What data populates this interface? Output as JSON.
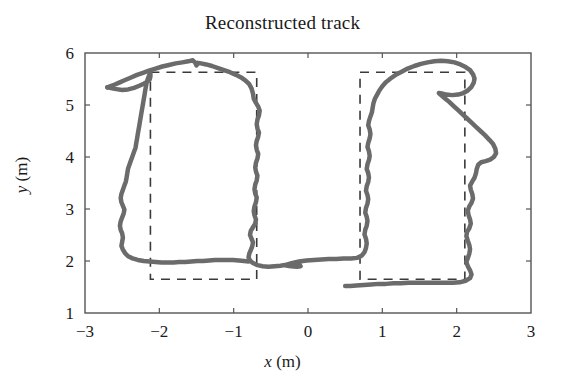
{
  "chart_data": {
    "type": "line",
    "title": "Reconstructed track",
    "xlabel": "x (m)",
    "ylabel": "y (m)",
    "xlabel_var": "x",
    "xlabel_unit": "(m)",
    "ylabel_var": "y",
    "ylabel_unit": "(m)",
    "xlim": [
      -3,
      3
    ],
    "ylim": [
      1,
      6
    ],
    "xticks": [
      -3,
      -2,
      -1,
      0,
      1,
      2,
      3
    ],
    "xtick_labels": [
      "−3",
      "−2",
      "−1",
      "0",
      "1",
      "2",
      "3"
    ],
    "yticks": [
      1,
      2,
      3,
      4,
      5,
      6
    ],
    "ytick_labels": [
      "1",
      "2",
      "3",
      "4",
      "5",
      "6"
    ],
    "grid": false,
    "legend": null,
    "series": [
      {
        "name": "reconstructed track",
        "style": "solid",
        "color": "#6b6b6b",
        "linewidth": 4.5,
        "points": [
          [
            -2.7,
            5.34
          ],
          [
            -2.62,
            5.38
          ],
          [
            -2.54,
            5.43
          ],
          [
            -2.46,
            5.48
          ],
          [
            -2.38,
            5.53
          ],
          [
            -2.3,
            5.58
          ],
          [
            -2.22,
            5.62
          ],
          [
            -2.14,
            5.66
          ],
          [
            -2.05,
            5.7
          ],
          [
            -1.96,
            5.74
          ],
          [
            -1.87,
            5.77
          ],
          [
            -1.78,
            5.8
          ],
          [
            -1.69,
            5.82
          ],
          [
            -1.61,
            5.84
          ],
          [
            -1.55,
            5.86
          ],
          [
            -1.52,
            5.82
          ],
          [
            -1.5,
            5.76
          ],
          [
            -1.48,
            5.81
          ],
          [
            -1.44,
            5.8
          ],
          [
            -1.37,
            5.78
          ],
          [
            -1.29,
            5.75
          ],
          [
            -1.21,
            5.71
          ],
          [
            -1.13,
            5.67
          ],
          [
            -1.05,
            5.63
          ],
          [
            -0.97,
            5.58
          ],
          [
            -0.9,
            5.53
          ],
          [
            -0.84,
            5.47
          ],
          [
            -0.79,
            5.4
          ],
          [
            -0.76,
            5.32
          ],
          [
            -0.74,
            5.22
          ],
          [
            -0.73,
            5.12
          ],
          [
            -0.7,
            5.04
          ],
          [
            -0.67,
            4.97
          ],
          [
            -0.65,
            4.89
          ],
          [
            -0.66,
            4.8
          ],
          [
            -0.68,
            4.72
          ],
          [
            -0.69,
            4.63
          ],
          [
            -0.68,
            4.55
          ],
          [
            -0.66,
            4.47
          ],
          [
            -0.67,
            4.39
          ],
          [
            -0.69,
            4.31
          ],
          [
            -0.7,
            4.23
          ],
          [
            -0.69,
            4.14
          ],
          [
            -0.67,
            4.06
          ],
          [
            -0.68,
            3.97
          ],
          [
            -0.7,
            3.89
          ],
          [
            -0.71,
            3.8
          ],
          [
            -0.7,
            3.72
          ],
          [
            -0.68,
            3.64
          ],
          [
            -0.69,
            3.55
          ],
          [
            -0.71,
            3.47
          ],
          [
            -0.72,
            3.38
          ],
          [
            -0.71,
            3.3
          ],
          [
            -0.69,
            3.22
          ],
          [
            -0.7,
            3.13
          ],
          [
            -0.72,
            3.05
          ],
          [
            -0.73,
            2.96
          ],
          [
            -0.72,
            2.88
          ],
          [
            -0.7,
            2.8
          ],
          [
            -0.71,
            2.72
          ],
          [
            -0.74,
            2.65
          ],
          [
            -0.77,
            2.58
          ],
          [
            -0.78,
            2.5
          ],
          [
            -0.76,
            2.43
          ],
          [
            -0.74,
            2.36
          ],
          [
            -0.75,
            2.28
          ],
          [
            -0.77,
            2.21
          ],
          [
            -0.79,
            2.14
          ],
          [
            -0.8,
            2.07
          ],
          [
            -0.78,
            2.01
          ],
          [
            -0.74,
            1.96
          ],
          [
            -0.68,
            1.92
          ],
          [
            -0.61,
            1.9
          ],
          [
            -0.53,
            1.89
          ],
          [
            -0.45,
            1.9
          ],
          [
            -0.37,
            1.91
          ],
          [
            -0.29,
            1.93
          ],
          [
            -0.22,
            1.95
          ],
          [
            -0.16,
            1.96
          ],
          [
            -0.12,
            1.94
          ],
          [
            -0.1,
            1.9
          ],
          [
            -0.15,
            1.89
          ],
          [
            -0.23,
            1.9
          ],
          [
            -0.31,
            1.92
          ],
          [
            -0.22,
            1.96
          ],
          [
            -0.12,
            1.99
          ],
          [
            -0.02,
            2.01
          ],
          [
            0.08,
            2.02
          ],
          [
            0.18,
            2.03
          ],
          [
            0.28,
            2.04
          ],
          [
            0.38,
            2.04
          ],
          [
            0.48,
            2.05
          ],
          [
            0.58,
            2.05
          ],
          [
            0.66,
            2.06
          ],
          [
            0.72,
            2.1
          ],
          [
            0.76,
            2.17
          ],
          [
            0.78,
            2.25
          ],
          [
            0.79,
            2.34
          ],
          [
            0.78,
            2.43
          ],
          [
            0.76,
            2.51
          ],
          [
            0.77,
            2.6
          ],
          [
            0.79,
            2.68
          ],
          [
            0.8,
            2.77
          ],
          [
            0.79,
            2.85
          ],
          [
            0.77,
            2.93
          ],
          [
            0.78,
            3.02
          ],
          [
            0.8,
            3.1
          ],
          [
            0.81,
            3.19
          ],
          [
            0.8,
            3.27
          ],
          [
            0.78,
            3.35
          ],
          [
            0.79,
            3.44
          ],
          [
            0.81,
            3.52
          ],
          [
            0.82,
            3.61
          ],
          [
            0.81,
            3.69
          ],
          [
            0.79,
            3.77
          ],
          [
            0.8,
            3.86
          ],
          [
            0.82,
            3.94
          ],
          [
            0.83,
            4.02
          ],
          [
            0.82,
            4.11
          ],
          [
            0.8,
            4.19
          ],
          [
            0.81,
            4.27
          ],
          [
            0.83,
            4.36
          ],
          [
            0.84,
            4.44
          ],
          [
            0.83,
            4.53
          ],
          [
            0.81,
            4.61
          ],
          [
            0.82,
            4.69
          ],
          [
            0.84,
            4.78
          ],
          [
            0.86,
            4.86
          ],
          [
            0.87,
            4.95
          ],
          [
            0.88,
            5.03
          ],
          [
            0.9,
            5.12
          ],
          [
            0.93,
            5.2
          ],
          [
            0.96,
            5.28
          ],
          [
            1.0,
            5.36
          ],
          [
            1.05,
            5.44
          ],
          [
            1.11,
            5.51
          ],
          [
            1.18,
            5.58
          ],
          [
            1.26,
            5.64
          ],
          [
            1.34,
            5.7
          ],
          [
            1.43,
            5.75
          ],
          [
            1.52,
            5.79
          ],
          [
            1.61,
            5.82
          ],
          [
            1.7,
            5.84
          ],
          [
            1.79,
            5.85
          ],
          [
            1.88,
            5.84
          ],
          [
            1.97,
            5.82
          ],
          [
            2.05,
            5.78
          ],
          [
            2.12,
            5.73
          ],
          [
            2.18,
            5.67
          ],
          [
            2.22,
            5.59
          ],
          [
            2.24,
            5.51
          ],
          [
            2.23,
            5.43
          ],
          [
            2.2,
            5.35
          ],
          [
            2.15,
            5.28
          ],
          [
            2.09,
            5.23
          ],
          [
            2.02,
            5.2
          ],
          [
            1.94,
            5.19
          ],
          [
            1.86,
            5.2
          ],
          [
            1.8,
            5.22
          ],
          [
            1.76,
            5.23
          ],
          [
            1.79,
            5.19
          ],
          [
            1.84,
            5.13
          ],
          [
            1.9,
            5.06
          ],
          [
            1.96,
            4.98
          ],
          [
            2.02,
            4.9
          ],
          [
            2.08,
            4.82
          ],
          [
            2.14,
            4.74
          ],
          [
            2.2,
            4.66
          ],
          [
            2.26,
            4.58
          ],
          [
            2.32,
            4.5
          ],
          [
            2.38,
            4.42
          ],
          [
            2.44,
            4.33
          ],
          [
            2.49,
            4.25
          ],
          [
            2.52,
            4.16
          ],
          [
            2.53,
            4.07
          ],
          [
            2.5,
            4.0
          ],
          [
            2.45,
            3.95
          ],
          [
            2.39,
            3.92
          ],
          [
            2.33,
            3.9
          ],
          [
            2.29,
            3.85
          ],
          [
            2.27,
            3.77
          ],
          [
            2.26,
            3.69
          ],
          [
            2.24,
            3.6
          ],
          [
            2.21,
            3.53
          ],
          [
            2.18,
            3.45
          ],
          [
            2.19,
            3.37
          ],
          [
            2.21,
            3.29
          ],
          [
            2.22,
            3.2
          ],
          [
            2.2,
            3.12
          ],
          [
            2.17,
            3.05
          ],
          [
            2.15,
            2.97
          ],
          [
            2.16,
            2.88
          ],
          [
            2.18,
            2.8
          ],
          [
            2.19,
            2.72
          ],
          [
            2.17,
            2.63
          ],
          [
            2.14,
            2.56
          ],
          [
            2.13,
            2.48
          ],
          [
            2.15,
            2.39
          ],
          [
            2.17,
            2.31
          ],
          [
            2.18,
            2.23
          ],
          [
            2.17,
            2.14
          ],
          [
            2.15,
            2.06
          ],
          [
            2.13,
            1.98
          ],
          [
            2.15,
            1.9
          ],
          [
            2.18,
            1.82
          ],
          [
            2.2,
            1.74
          ],
          [
            2.18,
            1.67
          ],
          [
            2.12,
            1.62
          ],
          [
            2.04,
            1.59
          ],
          [
            1.95,
            1.58
          ],
          [
            1.85,
            1.58
          ],
          [
            1.75,
            1.58
          ],
          [
            1.65,
            1.58
          ],
          [
            1.55,
            1.58
          ],
          [
            1.45,
            1.58
          ],
          [
            1.35,
            1.58
          ],
          [
            1.25,
            1.57
          ],
          [
            1.15,
            1.57
          ],
          [
            1.05,
            1.56
          ],
          [
            0.95,
            1.56
          ],
          [
            0.85,
            1.55
          ],
          [
            0.75,
            1.54
          ],
          [
            0.65,
            1.53
          ],
          [
            0.57,
            1.52
          ],
          [
            0.5,
            1.52
          ]
        ],
        "second_pass": [
          [
            -2.7,
            5.34
          ],
          [
            -2.6,
            5.31
          ],
          [
            -2.5,
            5.29
          ],
          [
            -2.42,
            5.3
          ],
          [
            -2.34,
            5.33
          ],
          [
            -2.27,
            5.37
          ],
          [
            -2.21,
            5.41
          ],
          [
            -2.16,
            5.45
          ],
          [
            -2.13,
            5.49
          ],
          [
            -2.12,
            5.55
          ],
          [
            -2.12,
            5.62
          ],
          [
            -2.13,
            5.6
          ],
          [
            -2.15,
            5.52
          ],
          [
            -2.17,
            5.44
          ],
          [
            -2.18,
            5.36
          ],
          [
            -2.19,
            5.28
          ],
          [
            -2.2,
            5.19
          ],
          [
            -2.21,
            5.11
          ],
          [
            -2.22,
            5.02
          ],
          [
            -2.23,
            4.94
          ],
          [
            -2.24,
            4.86
          ],
          [
            -2.25,
            4.77
          ],
          [
            -2.26,
            4.69
          ],
          [
            -2.27,
            4.6
          ],
          [
            -2.28,
            4.52
          ],
          [
            -2.29,
            4.44
          ],
          [
            -2.3,
            4.35
          ],
          [
            -2.31,
            4.27
          ],
          [
            -2.32,
            4.18
          ],
          [
            -2.34,
            4.1
          ],
          [
            -2.36,
            4.02
          ],
          [
            -2.38,
            3.94
          ],
          [
            -2.4,
            3.86
          ],
          [
            -2.42,
            3.78
          ],
          [
            -2.43,
            3.7
          ],
          [
            -2.44,
            3.61
          ],
          [
            -2.45,
            3.53
          ],
          [
            -2.47,
            3.45
          ],
          [
            -2.49,
            3.37
          ],
          [
            -2.51,
            3.29
          ],
          [
            -2.52,
            3.21
          ],
          [
            -2.51,
            3.13
          ],
          [
            -2.49,
            3.06
          ],
          [
            -2.47,
            2.99
          ],
          [
            -2.48,
            2.91
          ],
          [
            -2.5,
            2.84
          ],
          [
            -2.52,
            2.76
          ],
          [
            -2.53,
            2.68
          ],
          [
            -2.52,
            2.6
          ],
          [
            -2.5,
            2.53
          ],
          [
            -2.49,
            2.45
          ],
          [
            -2.5,
            2.37
          ],
          [
            -2.51,
            2.29
          ],
          [
            -2.49,
            2.22
          ],
          [
            -2.46,
            2.15
          ],
          [
            -2.42,
            2.09
          ],
          [
            -2.36,
            2.05
          ],
          [
            -2.29,
            2.02
          ],
          [
            -2.21,
            2.0
          ],
          [
            -2.13,
            1.99
          ],
          [
            -2.05,
            1.98
          ],
          [
            -1.97,
            1.97
          ],
          [
            -1.89,
            1.97
          ],
          [
            -1.81,
            1.97
          ],
          [
            -1.73,
            1.98
          ],
          [
            -1.65,
            1.98
          ],
          [
            -1.57,
            1.99
          ],
          [
            -1.49,
            2.0
          ],
          [
            -1.41,
            2.0
          ],
          [
            -1.33,
            2.01
          ],
          [
            -1.25,
            2.02
          ],
          [
            -1.17,
            2.02
          ],
          [
            -1.09,
            2.02
          ],
          [
            -1.01,
            2.02
          ],
          [
            -0.93,
            2.01
          ],
          [
            -0.86,
            2.0
          ],
          [
            -0.8,
            1.99
          ]
        ]
      }
    ],
    "reference_rectangles": [
      {
        "name": "left-reference-rectangle",
        "x0": -2.12,
        "x1": -0.69,
        "y0": 1.65,
        "y1": 5.63,
        "style": "dashed",
        "color": "#3a3a3a"
      },
      {
        "name": "right-reference-rectangle",
        "x0": 0.7,
        "x1": 2.11,
        "y0": 1.65,
        "y1": 5.63,
        "style": "dashed",
        "color": "#3a3a3a"
      }
    ],
    "colors": {
      "track": "#6b6b6b",
      "reference": "#3a3a3a",
      "axis": "#555555",
      "background": "#ffffff",
      "text": "#1a1a1a"
    }
  }
}
